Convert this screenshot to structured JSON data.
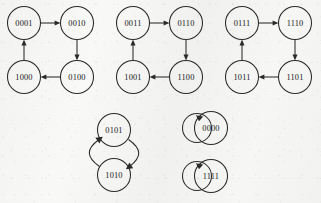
{
  "diagram": {
    "type": "state-transition-graph",
    "stroke_color": "#2a2a2a",
    "background_color": "#f7f7f6",
    "node_radius": 16.5,
    "components": [
      {
        "id": "component-1",
        "kind": "cycle-4",
        "nodes": [
          {
            "id": "n0001",
            "label": "0001",
            "cx": 24,
            "cy": 23
          },
          {
            "id": "n0010",
            "label": "0010",
            "cx": 77,
            "cy": 23
          },
          {
            "id": "n0100",
            "label": "0100",
            "cx": 77,
            "cy": 77
          },
          {
            "id": "n1000",
            "label": "1000",
            "cx": 24,
            "cy": 77
          }
        ],
        "edges": [
          {
            "from": "n0001",
            "to": "n0010",
            "direction": "right"
          },
          {
            "from": "n0010",
            "to": "n0100",
            "direction": "down"
          },
          {
            "from": "n0100",
            "to": "n1000",
            "direction": "left"
          },
          {
            "from": "n1000",
            "to": "n0001",
            "direction": "up"
          }
        ]
      },
      {
        "id": "component-2",
        "kind": "cycle-4",
        "nodes": [
          {
            "id": "n0011",
            "label": "0011",
            "cx": 133,
            "cy": 23
          },
          {
            "id": "n0110",
            "label": "0110",
            "cx": 186,
            "cy": 23
          },
          {
            "id": "n1100",
            "label": "1100",
            "cx": 186,
            "cy": 77
          },
          {
            "id": "n1001",
            "label": "1001",
            "cx": 133,
            "cy": 77
          }
        ],
        "edges": [
          {
            "from": "n0011",
            "to": "n0110",
            "direction": "right"
          },
          {
            "from": "n0110",
            "to": "n1100",
            "direction": "down"
          },
          {
            "from": "n1100",
            "to": "n1001",
            "direction": "left"
          },
          {
            "from": "n1001",
            "to": "n0011",
            "direction": "up"
          }
        ]
      },
      {
        "id": "component-3",
        "kind": "cycle-4",
        "nodes": [
          {
            "id": "n0111",
            "label": "0111",
            "cx": 242,
            "cy": 23
          },
          {
            "id": "n1110",
            "label": "1110",
            "cx": 295,
            "cy": 23
          },
          {
            "id": "n1101",
            "label": "1101",
            "cx": 295,
            "cy": 77
          },
          {
            "id": "n1011",
            "label": "1011",
            "cx": 242,
            "cy": 77
          }
        ],
        "edges": [
          {
            "from": "n0111",
            "to": "n1110",
            "direction": "right"
          },
          {
            "from": "n1110",
            "to": "n1101",
            "direction": "down"
          },
          {
            "from": "n1101",
            "to": "n1011",
            "direction": "left"
          },
          {
            "from": "n1011",
            "to": "n0111",
            "direction": "up"
          }
        ]
      },
      {
        "id": "component-4",
        "kind": "cycle-2",
        "nodes": [
          {
            "id": "n0101",
            "label": "0101",
            "cx": 114,
            "cy": 130
          },
          {
            "id": "n1010",
            "label": "1010",
            "cx": 114,
            "cy": 175
          }
        ],
        "edges": [
          {
            "from": "n0101",
            "to": "n1010",
            "direction": "curve-right-down"
          },
          {
            "from": "n1010",
            "to": "n0101",
            "direction": "curve-left-up"
          }
        ]
      },
      {
        "id": "component-5",
        "kind": "fixed-point",
        "nodes": [
          {
            "id": "n0000",
            "label": "0000",
            "cx": 211,
            "cy": 128
          }
        ],
        "edges": [
          {
            "from": "n0000",
            "to": "n0000",
            "direction": "self-loop-left"
          }
        ]
      },
      {
        "id": "component-6",
        "kind": "fixed-point",
        "nodes": [
          {
            "id": "n1111",
            "label": "1111",
            "cx": 211,
            "cy": 176
          }
        ],
        "edges": [
          {
            "from": "n1111",
            "to": "n1111",
            "direction": "self-loop-left"
          }
        ]
      }
    ]
  }
}
